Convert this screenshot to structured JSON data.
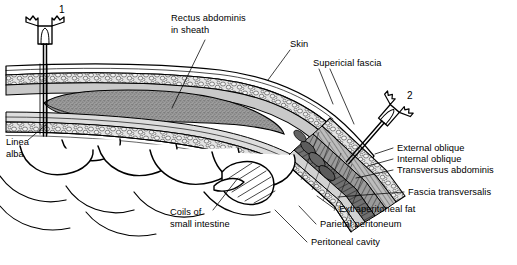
{
  "figure": {
    "background_color": "#ffffff",
    "ink_color": "#000000"
  },
  "needles": [
    {
      "id": "needle-1",
      "number": "1",
      "orientation": "vertical",
      "site": "linea alba / midline",
      "x": 64,
      "y": 12
    },
    {
      "id": "needle-2",
      "number": "2",
      "orientation": "oblique",
      "site": "lateral flank / oblique muscles",
      "x": 412,
      "y": 95
    }
  ],
  "labels": {
    "rectus": {
      "line1": "Rectus abdominis",
      "line2": "in sheath"
    },
    "skin": "Skin",
    "superficial_fascia": "Supericial fascia",
    "linea_alba": {
      "line1": "Linea",
      "line2": "alba"
    },
    "coils": {
      "line1": "Coils of",
      "line2": "small intestine"
    },
    "external_oblique": "External oblique",
    "internal_oblique": "Internal oblique",
    "transversus_abdominis": "Transversus abdominis",
    "fascia_transversalis": "Fascia transversalis",
    "extraperitoneal_fat": "Extraperitoneal fat",
    "parietal_peritoneum": "Parietal peritoneum",
    "peritoneal_cavity": "Peritoneal cavity"
  },
  "colors": {
    "muscle_stipple": "#8a8a8a",
    "fat_fill": "#dcdcdc",
    "fascia_fill": "#bdbdbd",
    "oblique_dark": "#6f6f6f",
    "oblique_mid": "#9a9a9a",
    "oblique_light": "#c8c8c8",
    "ink": "#000000",
    "paper": "#ffffff"
  }
}
